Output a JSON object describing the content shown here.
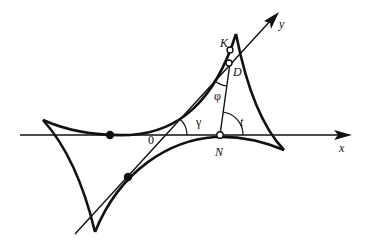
{
  "diagram": {
    "type": "geometric-construction",
    "colors": {
      "stroke": "#111111",
      "background": "#ffffff"
    },
    "axes": {
      "x_label": "x",
      "y_label": "y",
      "origin_label": "0"
    },
    "points": {
      "K": "K",
      "D": "D",
      "N": "N"
    },
    "angles": {
      "phi": "φ",
      "gamma": "γ",
      "t": "t"
    }
  }
}
